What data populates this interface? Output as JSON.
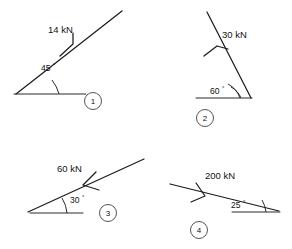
{
  "sheet": {
    "title": "Force vector diagrams",
    "background_color": "#ffffff",
    "line_color": "#1c1c1c",
    "figure_count": 4
  },
  "figures": [
    {
      "id": "figure-1",
      "number": "1",
      "force_label": "14 kN",
      "force_magnitude": 14,
      "force_unit": "kN",
      "angle_label": "30",
      "angle_value": 45,
      "angle_text": "45",
      "degree_symbol": "°",
      "direction": "up-right",
      "arrow_style": "half-arrow"
    },
    {
      "id": "figure-2",
      "number": "2",
      "force_label": "30 kN",
      "force_magnitude": 30,
      "force_unit": "kN",
      "angle_text": "60",
      "angle_value": 60,
      "degree_symbol": "°",
      "direction": "up-left",
      "arrow_style": "open-arrow"
    },
    {
      "id": "figure-3",
      "number": "3",
      "force_label": "60 kN",
      "force_magnitude": 60,
      "force_unit": "kN",
      "angle_text": "30",
      "angle_value": 30,
      "degree_symbol": "°",
      "direction": "down-left",
      "arrow_style": "open-arrow"
    },
    {
      "id": "figure-4",
      "number": "4",
      "force_label": "200 kN",
      "force_magnitude": 200,
      "force_unit": "kN",
      "angle_text": "25",
      "angle_value": 25,
      "degree_symbol": "°",
      "direction": "left",
      "arrow_style": "open-arrow"
    }
  ]
}
